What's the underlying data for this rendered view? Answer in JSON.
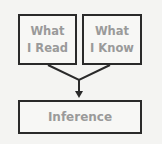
{
  "diagram": {
    "boxes": [
      {
        "line1": "What",
        "line2": "I Read"
      },
      {
        "line1": "What",
        "line2": "I Know"
      },
      {
        "label": "Inference"
      }
    ],
    "colors": {
      "stroke": "#2a2a2a",
      "text": "#9a9a9a",
      "background": "#f4f4f2"
    }
  }
}
